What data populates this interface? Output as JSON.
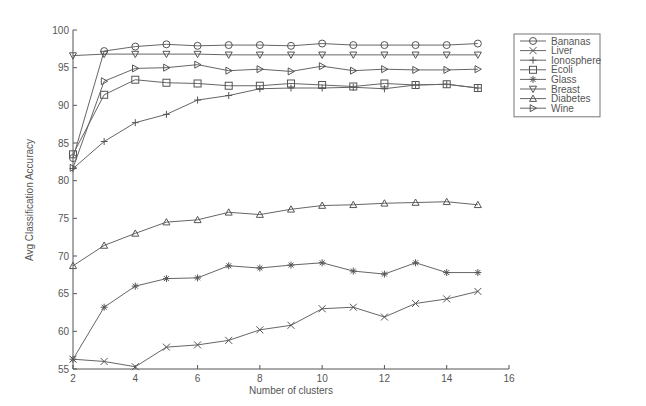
{
  "chart_data": {
    "type": "line",
    "title": "",
    "xlabel": "Number of clusters",
    "ylabel": "Avg Classification Accuracy",
    "xlim": [
      2,
      16
    ],
    "ylim": [
      55,
      100
    ],
    "xticks": [
      2,
      4,
      6,
      8,
      10,
      12,
      14,
      16
    ],
    "yticks": [
      55,
      60,
      65,
      70,
      75,
      80,
      85,
      90,
      95,
      100
    ],
    "grid": false,
    "legend_position": "upper right, outside plot",
    "x": [
      2,
      3,
      4,
      5,
      6,
      7,
      8,
      9,
      10,
      11,
      12,
      13,
      14,
      15
    ],
    "series": [
      {
        "name": "Bananas",
        "marker": "circle",
        "values": [
          83.0,
          97.2,
          97.8,
          98.1,
          97.9,
          98.0,
          98.0,
          97.9,
          98.2,
          98.0,
          98.0,
          98.0,
          98.0,
          98.2
        ]
      },
      {
        "name": "Liver",
        "marker": "x",
        "values": [
          56.3,
          56.0,
          55.3,
          57.9,
          58.2,
          58.8,
          60.2,
          60.8,
          63.0,
          63.2,
          61.9,
          63.7,
          64.3,
          65.3
        ]
      },
      {
        "name": "Ionosphere",
        "marker": "plus",
        "values": [
          81.6,
          85.2,
          87.7,
          88.8,
          90.7,
          91.3,
          92.2,
          92.3,
          92.3,
          92.4,
          92.2,
          92.7,
          92.8,
          92.3
        ]
      },
      {
        "name": "Ecoli",
        "marker": "square",
        "values": [
          83.5,
          91.4,
          93.4,
          93.0,
          92.9,
          92.6,
          92.6,
          92.9,
          92.7,
          92.5,
          92.9,
          92.7,
          92.8,
          92.3
        ]
      },
      {
        "name": "Glass",
        "marker": "star",
        "values": [
          56.3,
          63.2,
          66.0,
          67.0,
          67.1,
          68.7,
          68.4,
          68.8,
          69.1,
          68.0,
          67.6,
          69.1,
          67.8,
          67.8
        ]
      },
      {
        "name": "Breast",
        "marker": "triangle-down",
        "values": [
          96.6,
          96.8,
          96.8,
          96.8,
          96.8,
          96.7,
          96.7,
          96.7,
          96.7,
          96.7,
          96.7,
          96.7,
          96.7,
          96.7
        ]
      },
      {
        "name": "Diabetes",
        "marker": "triangle-up",
        "values": [
          68.7,
          71.4,
          73.0,
          74.5,
          74.8,
          75.8,
          75.5,
          76.2,
          76.7,
          76.8,
          77.0,
          77.1,
          77.2,
          76.8
        ]
      },
      {
        "name": "Wine",
        "marker": "triangle-right",
        "values": [
          81.7,
          93.2,
          94.9,
          95.0,
          95.4,
          94.6,
          94.8,
          94.5,
          95.2,
          94.6,
          94.8,
          94.7,
          94.7,
          94.8
        ]
      }
    ]
  },
  "colors": {
    "line": "#666666",
    "marker": "#555555",
    "axis": "#555555",
    "background": "#ffffff"
  }
}
